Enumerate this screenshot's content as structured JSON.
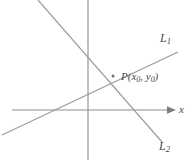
{
  "figure": {
    "background_color": "#ffffff",
    "line_color": "#9a9a9a",
    "axis_color": "#8d8d8d",
    "label_color": "#4a4a4a",
    "width": 192,
    "height": 162
  },
  "axes": {
    "x_axis_label": "x",
    "y_axis_label": "",
    "origin": {
      "x": 88,
      "y": 110
    }
  },
  "lines": [
    {
      "name": "L",
      "subscript": "1",
      "label_full": "L1",
      "from": {
        "x": 2,
        "y": 135
      },
      "to": {
        "x": 178,
        "y": 52
      },
      "direction": "rising"
    },
    {
      "name": "L",
      "subscript": "2",
      "label_full": "L2",
      "from": {
        "x": 38,
        "y": 0
      },
      "to": {
        "x": 162,
        "y": 142
      },
      "direction": "falling"
    }
  ],
  "point": {
    "label_prefix": "P(",
    "coord_x_name": "x",
    "coord_x_sub": "0",
    "separator": ", ",
    "coord_y_name": "y",
    "coord_y_sub": "0",
    "label_suffix": ")",
    "position": {
      "x": 113,
      "y": 76
    }
  }
}
